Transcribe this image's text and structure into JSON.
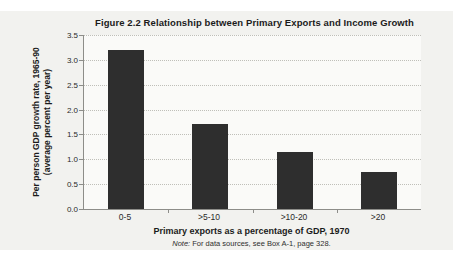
{
  "figure": {
    "title": "Figure 2.2  Relationship between Primary Exports and Income Growth",
    "ylabel_line1": "Per person GDP growth rate, 1965-90",
    "ylabel_line2": "(average percent per year)",
    "xlabel": "Primary exports as a percentage of GDP, 1970",
    "note_prefix": "Note:",
    "note_text": " For data sources, see Box A-1, page 328."
  },
  "colors": {
    "bar": "#2e2e2e",
    "panel_bg": "#f2f2ef",
    "plot_bg": "#fafaf8",
    "grid": "#bfbfb9",
    "axis": "#8d8d89",
    "text": "#1b1b1b"
  },
  "chart_data": {
    "type": "bar",
    "categories": [
      "0-5",
      ">5-10",
      ">10-20",
      ">20"
    ],
    "values": [
      3.2,
      1.7,
      1.15,
      0.75
    ],
    "title": "Figure 2.2  Relationship between Primary Exports and Income Growth",
    "xlabel": "Primary exports as a percentage of GDP, 1970",
    "ylabel": "Per person GDP growth rate, 1965-90 (average percent per year)",
    "ylim": [
      0,
      3.5
    ],
    "yticks": [
      0.0,
      0.5,
      1.0,
      1.5,
      2.0,
      2.5,
      3.0,
      3.5
    ],
    "grid": "horizontal dotted",
    "legend": "none",
    "bar_color": "#2e2e2e",
    "note": "Note: For data sources, see Box A-1, page 328."
  }
}
